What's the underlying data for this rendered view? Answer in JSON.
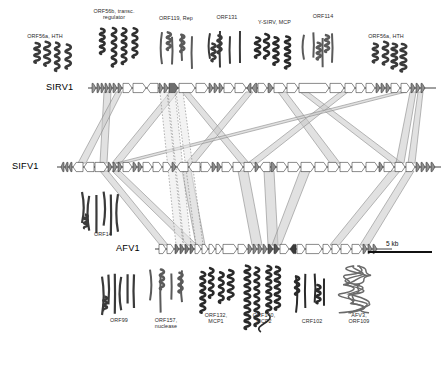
{
  "figure": {
    "type": "comparative-genome-map",
    "background": "#ffffff",
    "ink": "#2b2b2b",
    "ribbon_fill": "#c9c9c9",
    "ribbon_stroke": "#8a8a8a"
  },
  "genomes": [
    {
      "id": "sirv1",
      "name": "SIRV1",
      "label_x": 46,
      "label_y": 82,
      "track_y": 88,
      "x0": 88,
      "x1": 436
    },
    {
      "id": "sifv1",
      "name": "SIFV1",
      "label_x": 12,
      "label_y": 161,
      "track_y": 167,
      "x0": 57,
      "x1": 441
    },
    {
      "id": "afv1",
      "name": "AFV1",
      "label_x": 116,
      "label_y": 243,
      "track_y": 249,
      "x0": 155,
      "x1": 392
    }
  ],
  "scale_bar": {
    "label": "5 kb",
    "x": 368,
    "y": 252,
    "width": 64,
    "label_x": 386,
    "label_y": 240
  },
  "top_labels": [
    {
      "id": "orf56a-hth-left",
      "text": "ORF56a, HTH",
      "x": 14,
      "y": 33,
      "w": 62
    },
    {
      "id": "orf56b-transc-regulator",
      "text": "ORF56b, transc.\nregulator",
      "x": 82,
      "y": 8,
      "w": 64
    },
    {
      "id": "orf119-rep",
      "text": "ORF119, Rep",
      "x": 148,
      "y": 15,
      "w": 56
    },
    {
      "id": "orf131",
      "text": "ORF131",
      "x": 206,
      "y": 14,
      "w": 42
    },
    {
      "id": "y-sirv-mcp",
      "text": "Y-SIRV, MCP",
      "x": 247,
      "y": 19,
      "w": 55
    },
    {
      "id": "orf114",
      "text": "ORF114",
      "x": 302,
      "y": 13,
      "w": 42
    },
    {
      "id": "orf56a-hth-right",
      "text": "ORF56a, HTH",
      "x": 355,
      "y": 33,
      "w": 62
    }
  ],
  "side_labels": [
    {
      "id": "orf14",
      "text": "ORF14",
      "x": 84,
      "y": 231,
      "w": 38
    }
  ],
  "bottom_labels": [
    {
      "id": "orf99",
      "text": "ORF99",
      "x": 99,
      "y": 317,
      "w": 40
    },
    {
      "id": "orf157-nuclease",
      "text": "ORF157,\nnuclease",
      "x": 143,
      "y": 317,
      "w": 46
    },
    {
      "id": "orf132-mcp1",
      "text": "ORF132,\nMCP1",
      "x": 195,
      "y": 312,
      "w": 42
    },
    {
      "id": "orf140-mcp2",
      "text": "ORF140,\nMCP2",
      "x": 243,
      "y": 312,
      "w": 42
    },
    {
      "id": "crf102",
      "text": "CRF102",
      "x": 291,
      "y": 318,
      "w": 42
    },
    {
      "id": "afv3-orf109",
      "text": "AFV3,\nORF109",
      "x": 337,
      "y": 312,
      "w": 44
    }
  ],
  "gene_tracks": {
    "sirv1": [
      {
        "x": 92,
        "w": 4,
        "dir": 1,
        "fill": "#9a9a9a"
      },
      {
        "x": 97,
        "w": 3,
        "dir": 1,
        "fill": "#8f8f8f"
      },
      {
        "x": 101,
        "w": 3,
        "dir": 1,
        "fill": "#8f8f8f"
      },
      {
        "x": 105,
        "w": 3,
        "dir": 1,
        "fill": "#8f8f8f"
      },
      {
        "x": 109,
        "w": 3,
        "dir": 1,
        "fill": "#8f8f8f"
      },
      {
        "x": 113,
        "w": 4,
        "dir": 1,
        "fill": "#8f8f8f"
      },
      {
        "x": 118,
        "w": 4,
        "dir": 1,
        "fill": "#8f8f8f"
      },
      {
        "x": 123,
        "w": 9,
        "dir": 1,
        "fill": "#ffffff"
      },
      {
        "x": 133,
        "w": 13,
        "dir": 1,
        "fill": "#ffffff"
      },
      {
        "x": 147,
        "w": 11,
        "dir": -1,
        "fill": "#ffffff"
      },
      {
        "x": 159,
        "w": 4,
        "dir": 1,
        "fill": "#8f8f8f"
      },
      {
        "x": 164,
        "w": 4,
        "dir": 1,
        "fill": "#8f8f8f"
      },
      {
        "x": 169,
        "w": 9,
        "dir": 1,
        "fill": "#6e6e6e"
      },
      {
        "x": 179,
        "w": 16,
        "dir": 1,
        "fill": "#ffffff"
      },
      {
        "x": 196,
        "w": 12,
        "dir": 1,
        "fill": "#ffffff"
      },
      {
        "x": 209,
        "w": 4,
        "dir": 1,
        "fill": "#8f8f8f"
      },
      {
        "x": 214,
        "w": 4,
        "dir": 1,
        "fill": "#8f8f8f"
      },
      {
        "x": 219,
        "w": 4,
        "dir": 1,
        "fill": "#8f8f8f"
      },
      {
        "x": 224,
        "w": 10,
        "dir": 1,
        "fill": "#ffffff"
      },
      {
        "x": 235,
        "w": 11,
        "dir": 1,
        "fill": "#ffffff"
      },
      {
        "x": 247,
        "w": 4,
        "dir": -1,
        "fill": "#8f8f8f"
      },
      {
        "x": 252,
        "w": 5,
        "dir": -1,
        "fill": "#8f8f8f"
      },
      {
        "x": 258,
        "w": 9,
        "dir": 1,
        "fill": "#ffffff"
      },
      {
        "x": 268,
        "w": 5,
        "dir": 1,
        "fill": "#8f8f8f"
      },
      {
        "x": 274,
        "w": 12,
        "dir": 1,
        "fill": "#ffffff"
      },
      {
        "x": 287,
        "w": 11,
        "dir": 1,
        "fill": "#ffffff"
      },
      {
        "x": 299,
        "w": 30,
        "dir": 1,
        "fill": "#ffffff"
      },
      {
        "x": 330,
        "w": 14,
        "dir": 1,
        "fill": "#ffffff"
      },
      {
        "x": 345,
        "w": 10,
        "dir": 1,
        "fill": "#ffffff"
      },
      {
        "x": 356,
        "w": 9,
        "dir": 1,
        "fill": "#ffffff"
      },
      {
        "x": 366,
        "w": 9,
        "dir": 1,
        "fill": "#ffffff"
      },
      {
        "x": 376,
        "w": 4,
        "dir": 1,
        "fill": "#8f8f8f"
      },
      {
        "x": 381,
        "w": 4,
        "dir": 1,
        "fill": "#8f8f8f"
      },
      {
        "x": 386,
        "w": 4,
        "dir": 1,
        "fill": "#8f8f8f"
      },
      {
        "x": 391,
        "w": 9,
        "dir": 1,
        "fill": "#ffffff"
      },
      {
        "x": 401,
        "w": 9,
        "dir": 1,
        "fill": "#ffffff"
      },
      {
        "x": 411,
        "w": 4,
        "dir": 1,
        "fill": "#8f8f8f"
      },
      {
        "x": 416,
        "w": 4,
        "dir": 1,
        "fill": "#8f8f8f"
      },
      {
        "x": 421,
        "w": 4,
        "dir": 1,
        "fill": "#8f8f8f"
      }
    ],
    "sifv1": [
      {
        "x": 61,
        "w": 3,
        "dir": -1,
        "fill": "#8f8f8f"
      },
      {
        "x": 65,
        "w": 3,
        "dir": -1,
        "fill": "#8f8f8f"
      },
      {
        "x": 69,
        "w": 3,
        "dir": -1,
        "fill": "#8f8f8f"
      },
      {
        "x": 73,
        "w": 10,
        "dir": -1,
        "fill": "#ffffff"
      },
      {
        "x": 84,
        "w": 10,
        "dir": -1,
        "fill": "#ffffff"
      },
      {
        "x": 95,
        "w": 12,
        "dir": 1,
        "fill": "#ffffff"
      },
      {
        "x": 108,
        "w": 4,
        "dir": 1,
        "fill": "#8f8f8f"
      },
      {
        "x": 113,
        "w": 4,
        "dir": 1,
        "fill": "#8f8f8f"
      },
      {
        "x": 118,
        "w": 4,
        "dir": 1,
        "fill": "#8f8f8f"
      },
      {
        "x": 123,
        "w": 9,
        "dir": 1,
        "fill": "#ffffff"
      },
      {
        "x": 133,
        "w": 4,
        "dir": 1,
        "fill": "#8f8f8f"
      },
      {
        "x": 138,
        "w": 4,
        "dir": 1,
        "fill": "#8f8f8f"
      },
      {
        "x": 143,
        "w": 9,
        "dir": 1,
        "fill": "#ffffff"
      },
      {
        "x": 153,
        "w": 9,
        "dir": 1,
        "fill": "#ffffff"
      },
      {
        "x": 163,
        "w": 8,
        "dir": 1,
        "fill": "#ffffff"
      },
      {
        "x": 172,
        "w": 4,
        "dir": 1,
        "fill": "#8f8f8f"
      },
      {
        "x": 177,
        "w": 11,
        "dir": -1,
        "fill": "#ffffff"
      },
      {
        "x": 189,
        "w": 11,
        "dir": -1,
        "fill": "#ffffff"
      },
      {
        "x": 201,
        "w": 10,
        "dir": 1,
        "fill": "#ffffff"
      },
      {
        "x": 212,
        "w": 4,
        "dir": 1,
        "fill": "#8f8f8f"
      },
      {
        "x": 217,
        "w": 4,
        "dir": 1,
        "fill": "#8f8f8f"
      },
      {
        "x": 222,
        "w": 10,
        "dir": 1,
        "fill": "#ffffff"
      },
      {
        "x": 233,
        "w": 10,
        "dir": 1,
        "fill": "#ffffff"
      },
      {
        "x": 244,
        "w": 10,
        "dir": 1,
        "fill": "#ffffff"
      },
      {
        "x": 255,
        "w": 4,
        "dir": 1,
        "fill": "#8f8f8f"
      },
      {
        "x": 260,
        "w": 10,
        "dir": -1,
        "fill": "#ffffff"
      },
      {
        "x": 271,
        "w": 5,
        "dir": 1,
        "fill": "#8f8f8f"
      },
      {
        "x": 277,
        "w": 10,
        "dir": 1,
        "fill": "#ffffff"
      },
      {
        "x": 288,
        "w": 12,
        "dir": 1,
        "fill": "#ffffff"
      },
      {
        "x": 301,
        "w": 13,
        "dir": 1,
        "fill": "#ffffff"
      },
      {
        "x": 315,
        "w": 12,
        "dir": 1,
        "fill": "#ffffff"
      },
      {
        "x": 328,
        "w": 11,
        "dir": 1,
        "fill": "#ffffff"
      },
      {
        "x": 340,
        "w": 11,
        "dir": 1,
        "fill": "#ffffff"
      },
      {
        "x": 352,
        "w": 13,
        "dir": 1,
        "fill": "#ffffff"
      },
      {
        "x": 366,
        "w": 12,
        "dir": 1,
        "fill": "#ffffff"
      },
      {
        "x": 379,
        "w": 4,
        "dir": 1,
        "fill": "#8f8f8f"
      },
      {
        "x": 384,
        "w": 10,
        "dir": 1,
        "fill": "#ffffff"
      },
      {
        "x": 395,
        "w": 10,
        "dir": 1,
        "fill": "#ffffff"
      },
      {
        "x": 406,
        "w": 9,
        "dir": 1,
        "fill": "#ffffff"
      },
      {
        "x": 416,
        "w": 4,
        "dir": 1,
        "fill": "#8f8f8f"
      },
      {
        "x": 421,
        "w": 4,
        "dir": 1,
        "fill": "#8f8f8f"
      },
      {
        "x": 426,
        "w": 4,
        "dir": 1,
        "fill": "#8f8f8f"
      },
      {
        "x": 431,
        "w": 4,
        "dir": 1,
        "fill": "#8f8f8f"
      }
    ],
    "afv1": [
      {
        "x": 159,
        "w": 7,
        "dir": 1,
        "fill": "#ffffff"
      },
      {
        "x": 167,
        "w": 7,
        "dir": 1,
        "fill": "#ffffff"
      },
      {
        "x": 175,
        "w": 4,
        "dir": 1,
        "fill": "#7a7a7a"
      },
      {
        "x": 180,
        "w": 4,
        "dir": 1,
        "fill": "#7a7a7a"
      },
      {
        "x": 185,
        "w": 4,
        "dir": 1,
        "fill": "#7a7a7a"
      },
      {
        "x": 190,
        "w": 4,
        "dir": 1,
        "fill": "#7a7a7a"
      },
      {
        "x": 195,
        "w": 6,
        "dir": 1,
        "fill": "#ffffff"
      },
      {
        "x": 202,
        "w": 6,
        "dir": 1,
        "fill": "#ffffff"
      },
      {
        "x": 209,
        "w": 6,
        "dir": 1,
        "fill": "#ffffff"
      },
      {
        "x": 216,
        "w": 6,
        "dir": 1,
        "fill": "#ffffff"
      },
      {
        "x": 223,
        "w": 14,
        "dir": 1,
        "fill": "#ffffff"
      },
      {
        "x": 238,
        "w": 9,
        "dir": 1,
        "fill": "#ffffff"
      },
      {
        "x": 248,
        "w": 4,
        "dir": 1,
        "fill": "#8f8f8f"
      },
      {
        "x": 253,
        "w": 4,
        "dir": 1,
        "fill": "#8f8f8f"
      },
      {
        "x": 258,
        "w": 4,
        "dir": 1,
        "fill": "#8f8f8f"
      },
      {
        "x": 263,
        "w": 4,
        "dir": 1,
        "fill": "#8f8f8f"
      },
      {
        "x": 268,
        "w": 5,
        "dir": 1,
        "fill": "#555555"
      },
      {
        "x": 274,
        "w": 5,
        "dir": 1,
        "fill": "#555555"
      },
      {
        "x": 280,
        "w": 9,
        "dir": 1,
        "fill": "#ffffff"
      },
      {
        "x": 290,
        "w": 6,
        "dir": -1,
        "fill": "#3a3a3a"
      },
      {
        "x": 297,
        "w": 8,
        "dir": 1,
        "fill": "#ffffff"
      },
      {
        "x": 306,
        "w": 16,
        "dir": 1,
        "fill": "#ffffff"
      },
      {
        "x": 323,
        "w": 8,
        "dir": 1,
        "fill": "#ffffff"
      },
      {
        "x": 332,
        "w": 8,
        "dir": 1,
        "fill": "#ffffff"
      },
      {
        "x": 341,
        "w": 10,
        "dir": 1,
        "fill": "#ffffff"
      },
      {
        "x": 352,
        "w": 10,
        "dir": 1,
        "fill": "#ffffff"
      },
      {
        "x": 363,
        "w": 4,
        "dir": 1,
        "fill": "#8f8f8f"
      },
      {
        "x": 368,
        "w": 4,
        "dir": 1,
        "fill": "#8f8f8f"
      },
      {
        "x": 373,
        "w": 4,
        "dir": 1,
        "fill": "#8f8f8f"
      }
    ]
  },
  "ribbons": [
    {
      "id": "r1",
      "top_x": 104,
      "top_w": 7,
      "bot_x": 100,
      "bot_w": 7,
      "y1": 92,
      "y2": 163
    },
    {
      "id": "r2",
      "top_x": 116,
      "top_w": 6,
      "bot_x": 78,
      "bot_w": 8,
      "y1": 92,
      "y2": 163
    },
    {
      "id": "r3",
      "top_x": 170,
      "top_w": 8,
      "bot_x": 112,
      "bot_w": 9,
      "y1": 92,
      "y2": 163
    },
    {
      "id": "r4",
      "top_x": 182,
      "top_w": 7,
      "bot_x": 240,
      "bot_w": 9,
      "y1": 92,
      "y2": 163
    },
    {
      "id": "r5",
      "top_x": 246,
      "top_w": 7,
      "bot_x": 186,
      "bot_w": 9,
      "y1": 92,
      "y2": 163
    },
    {
      "id": "r6",
      "top_x": 278,
      "top_w": 8,
      "bot_x": 330,
      "bot_w": 10,
      "y1": 92,
      "y2": 163
    },
    {
      "id": "r7",
      "top_x": 300,
      "top_w": 8,
      "bot_x": 392,
      "bot_w": 10,
      "y1": 92,
      "y2": 163
    },
    {
      "id": "r8",
      "top_x": 340,
      "top_w": 8,
      "bot_x": 248,
      "bot_w": 10,
      "y1": 92,
      "y2": 163
    },
    {
      "id": "r9",
      "top_x": 396,
      "top_w": 10,
      "bot_x": 116,
      "bot_w": 10,
      "y1": 92,
      "y2": 163
    },
    {
      "id": "r10",
      "top_x": 410,
      "top_w": 6,
      "bot_x": 396,
      "bot_w": 8,
      "y1": 92,
      "y2": 163
    },
    {
      "id": "r11",
      "top_x": 418,
      "top_w": 5,
      "bot_x": 408,
      "bot_w": 7,
      "y1": 92,
      "y2": 163
    },
    {
      "id": "b1",
      "top_x": 100,
      "top_w": 8,
      "bot_x": 160,
      "bot_w": 8,
      "y1": 171,
      "y2": 245
    },
    {
      "id": "b2",
      "top_x": 112,
      "top_w": 8,
      "bot_x": 188,
      "bot_w": 9,
      "y1": 171,
      "y2": 245
    },
    {
      "id": "b3",
      "top_x": 182,
      "top_w": 9,
      "bot_x": 196,
      "bot_w": 9,
      "y1": 171,
      "y2": 245
    },
    {
      "id": "b4",
      "top_x": 238,
      "top_w": 10,
      "bot_x": 252,
      "bot_w": 10,
      "y1": 171,
      "y2": 245
    },
    {
      "id": "b5",
      "top_x": 264,
      "top_w": 10,
      "bot_x": 268,
      "bot_w": 10,
      "y1": 171,
      "y2": 245
    },
    {
      "id": "b6",
      "top_x": 300,
      "top_w": 10,
      "bot_x": 272,
      "bot_w": 9,
      "y1": 171,
      "y2": 245
    },
    {
      "id": "b7",
      "top_x": 390,
      "top_w": 10,
      "bot_x": 330,
      "bot_w": 9,
      "y1": 171,
      "y2": 245
    },
    {
      "id": "b8",
      "top_x": 406,
      "top_w": 8,
      "bot_x": 360,
      "bot_w": 9,
      "y1": 171,
      "y2": 245
    }
  ],
  "dotted_bands": [
    {
      "id": "d1",
      "top_x": 160,
      "bot_x": 176,
      "y1": 92,
      "y2": 245
    },
    {
      "id": "d2",
      "top_x": 168,
      "bot_x": 184,
      "y1": 92,
      "y2": 245
    },
    {
      "id": "d3",
      "top_x": 176,
      "bot_x": 196,
      "y1": 92,
      "y2": 245
    }
  ],
  "structures": [
    {
      "id": "struct-orf56a-left",
      "kind": "helix-bundle",
      "x": 32,
      "y": 36,
      "w": 42,
      "h": 34,
      "tone": "#3a3a3a"
    },
    {
      "id": "struct-orf56b",
      "kind": "helix-bundle",
      "x": 96,
      "y": 24,
      "w": 46,
      "h": 44,
      "tone": "#303030"
    },
    {
      "id": "struct-orf119",
      "kind": "mixed-ab",
      "x": 156,
      "y": 26,
      "w": 44,
      "h": 46,
      "tone": "#5a5a5a"
    },
    {
      "id": "struct-orf131",
      "kind": "mixed-ab",
      "x": 204,
      "y": 24,
      "w": 44,
      "h": 46,
      "tone": "#3a3a3a"
    },
    {
      "id": "struct-y-sirv-mcp",
      "kind": "helix-bundle",
      "x": 250,
      "y": 30,
      "w": 42,
      "h": 36,
      "tone": "#2a2a2a"
    },
    {
      "id": "struct-orf114",
      "kind": "mixed-ab",
      "x": 298,
      "y": 26,
      "w": 42,
      "h": 44,
      "tone": "#5a5a5a"
    },
    {
      "id": "struct-orf56a-right",
      "kind": "helix-bundle",
      "x": 368,
      "y": 36,
      "w": 42,
      "h": 34,
      "tone": "#3a3a3a"
    },
    {
      "id": "struct-orf14",
      "kind": "beta-barrel",
      "x": 78,
      "y": 186,
      "w": 46,
      "h": 46,
      "tone": "#3a3a3a"
    },
    {
      "id": "struct-orf99",
      "kind": "beta-barrel",
      "x": 98,
      "y": 268,
      "w": 42,
      "h": 46,
      "tone": "#3a3a3a"
    },
    {
      "id": "struct-orf157",
      "kind": "mixed-ab",
      "x": 144,
      "y": 262,
      "w": 46,
      "h": 52,
      "tone": "#5a5a5a"
    },
    {
      "id": "struct-orf132",
      "kind": "helix-bundle",
      "x": 196,
      "y": 264,
      "w": 40,
      "h": 46,
      "tone": "#2a2a2a"
    },
    {
      "id": "struct-orf140",
      "kind": "helix-long",
      "x": 242,
      "y": 260,
      "w": 42,
      "h": 72,
      "tone": "#2a2a2a"
    },
    {
      "id": "struct-crf102",
      "kind": "mixed-ab",
      "x": 290,
      "y": 266,
      "w": 42,
      "h": 48,
      "tone": "#2a2a2a"
    },
    {
      "id": "struct-afv3-orf109",
      "kind": "loopy",
      "x": 334,
      "y": 262,
      "w": 46,
      "h": 52,
      "tone": "#6a6a6a"
    }
  ]
}
